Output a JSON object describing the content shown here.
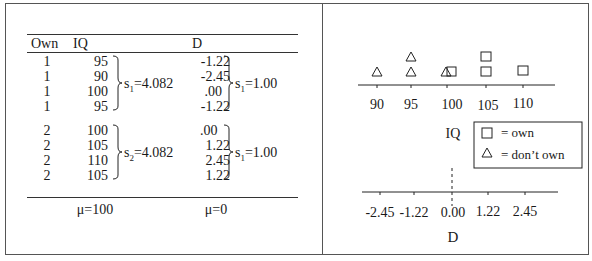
{
  "table": {
    "headers": {
      "own": "Own",
      "iq": "IQ",
      "d": "D"
    },
    "rows": [
      {
        "own": "1",
        "iq": "95",
        "d": "-1.22"
      },
      {
        "own": "1",
        "iq": "90",
        "d": "-2.45"
      },
      {
        "own": "1",
        "iq": "100",
        "d": ".00"
      },
      {
        "own": "1",
        "iq": "95",
        "d": "-1.22"
      },
      {
        "own": "2",
        "iq": "100",
        "d": ".00"
      },
      {
        "own": "2",
        "iq": "105",
        "d": "1.22"
      },
      {
        "own": "2",
        "iq": "110",
        "d": "2.45"
      },
      {
        "own": "2",
        "iq": "105",
        "d": "1.22"
      }
    ],
    "group1": {
      "iq_sd_label": "s",
      "iq_sd_sub": "1",
      "iq_sd_value": "=4.082",
      "d_sd_label": "s",
      "d_sd_sub": "1",
      "d_sd_value": "=1.00"
    },
    "group2": {
      "iq_sd_label": "s",
      "iq_sd_sub": "2",
      "iq_sd_value": "=4.082",
      "d_sd_label": "s",
      "d_sd_sub": "1",
      "d_sd_value": "=1.00"
    },
    "footer": {
      "iq_mean": "μ=100",
      "d_mean": "μ=0"
    }
  },
  "plot": {
    "iq_axis": {
      "label": "IQ",
      "ticks": [
        "90",
        "95",
        "100",
        "105",
        "110"
      ]
    },
    "d_axis": {
      "label": "D",
      "ticks": [
        "-2.45",
        "-1.22",
        "0.00",
        "1.22",
        "2.45"
      ]
    },
    "legend": {
      "own": {
        "symbol": "square-icon",
        "label": "= own"
      },
      "dont_own": {
        "symbol": "triangle-icon",
        "label": "= don’t own"
      }
    },
    "points": {
      "dont_own_iq": [
        90,
        95,
        95,
        100
      ],
      "own_iq": [
        100,
        105,
        105,
        110
      ]
    }
  }
}
